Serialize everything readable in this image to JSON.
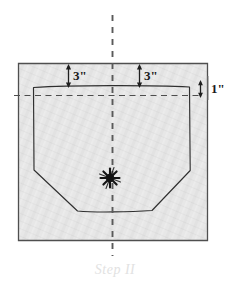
{
  "figure": {
    "title": "Step II",
    "caption": "Step II",
    "fabric": {
      "name": "fabric-rectangle",
      "fill": "#e6e6e6",
      "stroke": "#4a4a4a"
    },
    "pattern": {
      "name": "pattern-outline",
      "stroke": "#3a3a3a",
      "description": "rectangle with chamfered bottom corners"
    },
    "center_marker": {
      "name": "center-star-marker",
      "fill": "#1a1a1a",
      "points": 8
    },
    "fold_lines": {
      "vertical_label": "vertical center fold line",
      "horizontal_label": "horizontal guide line",
      "color": "#555555",
      "style": "dashed"
    },
    "dimensions": [
      {
        "id": "left-top-margin",
        "label": "3\"",
        "orientation": "vertical",
        "arrow": "double"
      },
      {
        "id": "right-top-margin",
        "label": "3\"",
        "orientation": "vertical",
        "arrow": "double"
      },
      {
        "id": "right-side-offset",
        "label": "1\"",
        "orientation": "vertical",
        "arrow": "double"
      }
    ]
  }
}
